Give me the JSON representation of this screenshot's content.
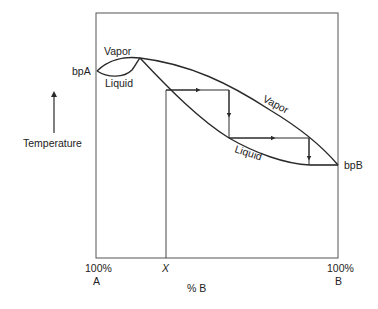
{
  "diagram": {
    "labels": {
      "vapor_left": "Vapor",
      "liquid_left": "Liquid",
      "vapor_right": "Vapor",
      "liquid_right": "Liquid",
      "bp_a": "bpA",
      "bp_b": "bpB",
      "y_axis": "Temperature",
      "x_axis": "% B",
      "x_left_pct": "100%",
      "x_left_comp": "A",
      "x_right_pct": "100%",
      "x_right_comp": "B",
      "x_marker": "X"
    },
    "colors": {
      "line": "#2a2a2a",
      "text": "#222222",
      "background": "#ffffff"
    }
  }
}
